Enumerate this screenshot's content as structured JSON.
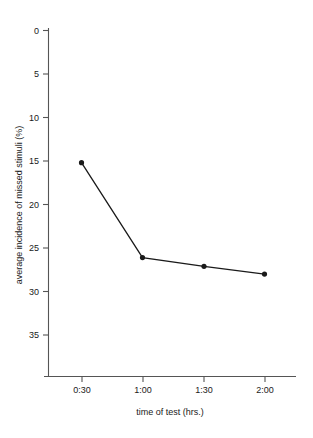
{
  "chart_data": {
    "type": "line",
    "title": "",
    "subtitle": "",
    "xlabel": "time of test (hrs.)",
    "ylabel": "average incidence of missed stimuli (%)",
    "categories": [
      "0:30",
      "1:00",
      "1:30",
      "2:00"
    ],
    "x": [
      "0:30",
      "1:00",
      "1:30",
      "2:00"
    ],
    "values": [
      15.2,
      26.1,
      27.1,
      28.0
    ],
    "series": [
      {
        "name": "average incidence of missed stimuli",
        "values": [
          15.2,
          26.1,
          27.1,
          28.0
        ]
      }
    ],
    "y_ticks": [
      0,
      5,
      10,
      15,
      20,
      25,
      30,
      35
    ],
    "y_tick_labels": [
      "0",
      "5",
      "10",
      "15",
      "20",
      "25",
      "30",
      "35"
    ],
    "x_tick_labels": [
      "0:30",
      "1:00",
      "1:30",
      "2:00"
    ],
    "ylim": [
      0,
      40
    ],
    "y_axis_inverted": true,
    "grid": false,
    "legend": false,
    "legend_position": "none",
    "marker": "filled-circle",
    "line_color": "#1a1a1a",
    "axis_color": "#555555",
    "background_color": "#ffffff"
  },
  "axes": {
    "y_title": "average incidence of missed stimuli (%)",
    "x_title": "time of test (hrs.)",
    "y_labels": {
      "t0": "0",
      "t1": "5",
      "t2": "10",
      "t3": "15",
      "t4": "20",
      "t5": "25",
      "t6": "30",
      "t7": "35"
    },
    "x_labels": {
      "t0": "0:30",
      "t1": "1:00",
      "t2": "1:30",
      "t3": "2:00"
    }
  }
}
